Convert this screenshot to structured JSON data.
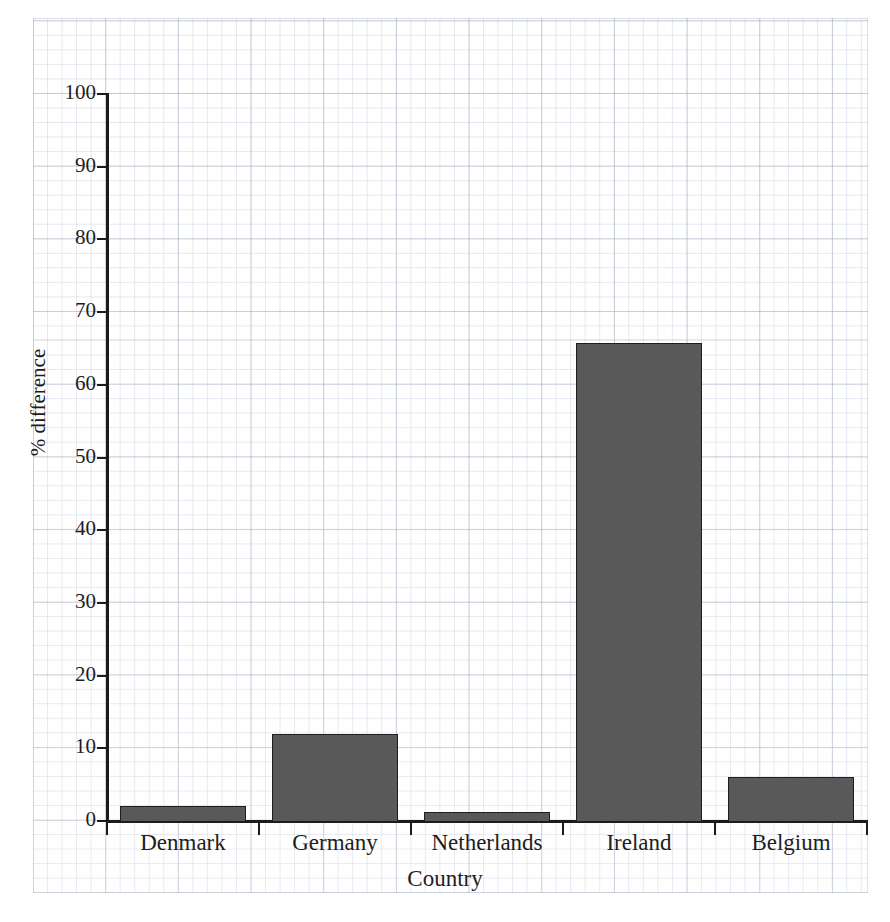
{
  "chart_data": {
    "type": "bar",
    "title": "",
    "subtitle": "",
    "xlabel": "Country",
    "ylabel": "% difference",
    "categories": [
      "Denmark",
      "Germany",
      "Netherlands",
      "Ireland",
      "Belgium"
    ],
    "values": [
      2,
      12,
      1.3,
      65.8,
      6
    ],
    "series": [
      {
        "name": "% difference",
        "values": [
          2,
          12,
          1.3,
          65.8,
          6
        ]
      }
    ],
    "ylim": [
      0,
      100
    ],
    "yticks": [
      0,
      10,
      20,
      30,
      40,
      50,
      60,
      70,
      80,
      90,
      100
    ],
    "ytick_labels": [
      "0",
      "10",
      "20",
      "30",
      "40",
      "50",
      "60",
      "70",
      "80",
      "90",
      "100"
    ],
    "xlim_categories": 5,
    "grid": true,
    "grid_style": "graph-paper",
    "legend": "none",
    "bar_color": "#595959",
    "bar_edge_color": "#1e1e1e",
    "axis_color": "#1b1b1b",
    "background_color": "#ffffff",
    "grid_color": "#9aa4b4",
    "annotations": []
  },
  "figure": {
    "paper_label": "graph-paper-sheet"
  }
}
